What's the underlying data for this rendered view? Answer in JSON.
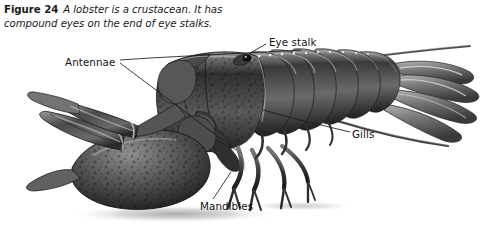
{
  "figure": {
    "number": "Figure 24",
    "caption": "A lobster is a crustacean. It has compound eyes on the end of eye stalks.",
    "subject": "lobster",
    "image_type": "grayscale-photograph",
    "background_color": "#ffffff",
    "text_color": "#111111",
    "width": 503,
    "height": 232
  },
  "labels": [
    {
      "id": "antennae",
      "text": "Antennae",
      "x": 65,
      "y": 57,
      "leader_to": [
        [
          150,
          58
        ],
        [
          300,
          51
        ]
      ]
    },
    {
      "id": "eye_stalk",
      "text": "Eye stalk",
      "x": 269,
      "y": 37,
      "leader_to": [
        [
          266,
          44
        ],
        [
          243,
          56
        ]
      ]
    },
    {
      "id": "gills",
      "text": "Gills",
      "x": 352,
      "y": 129,
      "leader_to": [
        [
          348,
          132
        ],
        [
          268,
          113
        ]
      ]
    },
    {
      "id": "mandibles",
      "text": "Mandibles",
      "x": 200,
      "y": 201,
      "leader_to": [
        [
          214,
          199
        ],
        [
          232,
          173
        ]
      ]
    }
  ],
  "anatomy_parts": [
    "antennae",
    "eye stalk",
    "compound eye",
    "gills",
    "mandibles",
    "cheliped (large claw)",
    "walking legs",
    "carapace",
    "abdomen segments",
    "tail fan"
  ],
  "colors": {
    "shell_dark": "#3d3d3d",
    "shell_mid": "#6f6f6f",
    "shell_light": "#a8a8a8",
    "shell_highlight": "#d8d8d8",
    "gill_light": "#ebebeb",
    "gill_line": "#9b9b9b",
    "shadow": "#c6c6c6",
    "leader_line": "#1a1a1a"
  }
}
